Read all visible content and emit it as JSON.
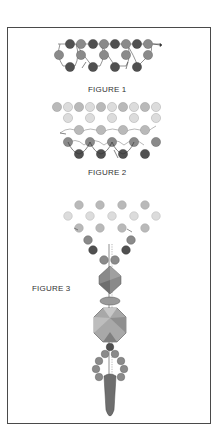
{
  "figures": [
    {
      "id": 1,
      "caption": "FIGURE 1"
    },
    {
      "id": 2,
      "caption": "FIGURE 2"
    },
    {
      "id": 3,
      "caption": "FIGURE 3"
    }
  ],
  "colors": {
    "border": "#4a4a4a",
    "bead_dark": "#505050",
    "bead_mid": "#8a8a8a",
    "bead_light": "#b9b9b9",
    "bead_pale": "#dcdcdc",
    "thread": "#666666",
    "drop": "#6e6e6e"
  },
  "annotations": {
    "fig1_labels": [
      "a",
      "b",
      "c",
      "d",
      "e",
      "f"
    ],
    "fig2_labels": [
      "a",
      "b",
      "c"
    ],
    "fig3_labels": [
      "a",
      "b"
    ]
  }
}
